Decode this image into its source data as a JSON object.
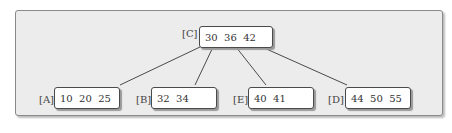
{
  "diagram": {
    "type": "b-tree",
    "root": {
      "id": "C",
      "label": "[C]",
      "keys": "30  36  42"
    },
    "children": [
      {
        "id": "A",
        "label": "[A]",
        "keys": "10  20  25"
      },
      {
        "id": "B",
        "label": "[B]",
        "keys": "32  34"
      },
      {
        "id": "E",
        "label": "[E]",
        "keys": "40  41"
      },
      {
        "id": "D",
        "label": "[D]",
        "keys": "44  50  55"
      }
    ],
    "edges": [
      {
        "from": "C",
        "to": "A"
      },
      {
        "from": "C",
        "to": "B"
      },
      {
        "from": "C",
        "to": "E"
      },
      {
        "from": "C",
        "to": "D"
      }
    ],
    "colors": {
      "panel_background": "#ececec",
      "node_background": "#ffffff",
      "edge": "#4a4a4a"
    }
  }
}
